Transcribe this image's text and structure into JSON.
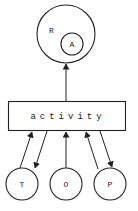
{
  "diagram": {
    "outer_node": {
      "label": "R",
      "inner": {
        "label": "A"
      }
    },
    "center_box": {
      "label": "activity"
    },
    "bottom_nodes": [
      {
        "id": "T",
        "label": "T"
      },
      {
        "id": "O",
        "label": "O"
      },
      {
        "id": "P",
        "label": "P"
      }
    ],
    "edges": [
      {
        "from": "activity",
        "to": "R"
      },
      {
        "from": "T",
        "to": "activity"
      },
      {
        "from": "activity",
        "to": "T"
      },
      {
        "from": "O",
        "to": "activity"
      },
      {
        "from": "P",
        "to": "activity"
      },
      {
        "from": "activity",
        "to": "P"
      }
    ],
    "stroke_color": "#222222"
  }
}
